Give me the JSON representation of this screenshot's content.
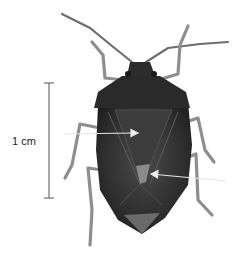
{
  "figure": {
    "scale_bar": {
      "label": "1 cm"
    },
    "colors": {
      "background": "#ffffff",
      "body_dark": "#2a2a2a",
      "body_mid": "#4a4a4a",
      "legs": "#8a8a8a",
      "scutellum": "#6a6a6a",
      "arrow": "#e0e0e0",
      "scale_line": "#555555"
    },
    "arrows": [
      {
        "name": "arrow-left",
        "from": [
          65,
          134
        ],
        "to": [
          137,
          133
        ]
      },
      {
        "name": "arrow-right",
        "from": [
          226,
          181
        ],
        "to": [
          152,
          174
        ]
      }
    ]
  }
}
